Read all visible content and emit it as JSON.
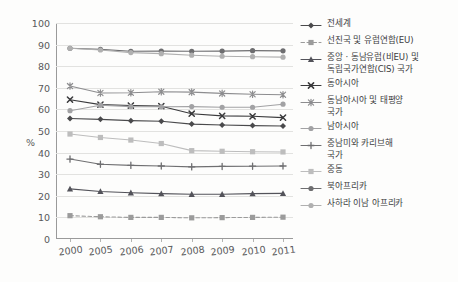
{
  "chart_data": {
    "type": "line",
    "title": "",
    "subtitle": "",
    "xlabel": "",
    "ylabel": "%",
    "ylim": [
      0,
      100
    ],
    "ytick_step": 10,
    "yticks": [
      0,
      10,
      20,
      30,
      40,
      50,
      60,
      70,
      80,
      90,
      100
    ],
    "grid": true,
    "legend_position": "right",
    "categories": [
      "2000",
      "2005",
      "2006",
      "2007",
      "2008",
      "2009",
      "2010",
      "2011"
    ],
    "x": [
      2000,
      2005,
      2006,
      2007,
      2008,
      2009,
      2010,
      2011
    ],
    "series": [
      {
        "name": "전세계",
        "values": [
          55.8,
          55.4,
          54.8,
          54.5,
          53.2,
          52.8,
          52.5,
          52.3
        ],
        "color": "#4a4a4c",
        "marker": "diamond",
        "dash": "solid"
      },
      {
        "name": "선진국 및 유럽연합(EU)",
        "values": [
          10.8,
          10.3,
          10.0,
          10.0,
          9.8,
          9.9,
          10.0,
          10.1
        ],
        "color": "#9b9b9b",
        "marker": "square",
        "dash": "dashed"
      },
      {
        "name": "중앙 · 동남유럽(비EU) 및\n독립국가연합(CIS) 국가",
        "values": [
          23.2,
          22.0,
          21.4,
          21.0,
          20.7,
          20.7,
          21.0,
          21.1
        ],
        "color": "#53535a",
        "marker": "triangle",
        "dash": "solid"
      },
      {
        "name": "동아시아",
        "values": [
          64.5,
          62.2,
          61.8,
          61.5,
          58.0,
          57.0,
          56.8,
          56.2
        ],
        "color": "#3a3a3c",
        "marker": "cross",
        "dash": "solid"
      },
      {
        "name": "동남아시아 및 태평양\n국가",
        "values": [
          70.8,
          67.6,
          67.7,
          68.2,
          68.0,
          67.4,
          67.0,
          66.8
        ],
        "color": "#8d8d8f",
        "marker": "asterisk",
        "dash": "solid"
      },
      {
        "name": "남아시아",
        "values": [
          59.4,
          61.9,
          61.3,
          61.2,
          61.3,
          61.0,
          61.0,
          62.4
        ],
        "color": "#a2a2a4",
        "marker": "dot",
        "dash": "solid"
      },
      {
        "name": "중남미와 카리브해\n국가",
        "values": [
          37.0,
          34.6,
          34.1,
          33.8,
          33.4,
          33.6,
          33.7,
          33.8
        ],
        "color": "#6f6f71",
        "marker": "plus",
        "dash": "solid"
      },
      {
        "name": "중동",
        "values": [
          48.6,
          47.0,
          45.8,
          44.2,
          40.9,
          40.6,
          40.4,
          40.3
        ],
        "color": "#bdbdbd",
        "marker": "square",
        "dash": "solid"
      },
      {
        "name": "북아프리카",
        "values": [
          88.3,
          87.8,
          86.9,
          87.0,
          86.9,
          87.0,
          87.2,
          87.1
        ],
        "color": "#6e6e70",
        "marker": "dot",
        "dash": "solid"
      },
      {
        "name": "사하라 이남 아프리카",
        "values": [
          88.3,
          87.5,
          86.3,
          85.8,
          85.1,
          84.6,
          84.4,
          84.2
        ],
        "color": "#b0b0b0",
        "marker": "dot",
        "dash": "solid"
      }
    ]
  },
  "axes": {
    "y_unit_label": "%",
    "ytick_labels": [
      "100",
      "90",
      "80",
      "70",
      "60",
      "50",
      "40",
      "30",
      "20",
      "10",
      "0"
    ],
    "xtick_labels": [
      "2000",
      "2005",
      "2006",
      "2007",
      "2008",
      "2009",
      "2010",
      "2011"
    ]
  },
  "legend": {
    "items": [
      {
        "label": "전세계"
      },
      {
        "label": "선진국 및 유럽연합(EU)"
      },
      {
        "label": "중앙 · 동남유럽(비EU) 및\n독립국가연합(CIS) 국가"
      },
      {
        "label": "동아시아"
      },
      {
        "label": "동남아시아 및 태평양\n국가"
      },
      {
        "label": "남아시아"
      },
      {
        "label": "중남미와 카리브해\n국가"
      },
      {
        "label": "중동"
      },
      {
        "label": "북아프리카"
      },
      {
        "label": "사하라 이남 아프리카"
      }
    ]
  },
  "colors": {
    "background": "#fdfdfc",
    "grid": "#e2e2e0",
    "axis": "#9a9a9a",
    "text": "#58585a"
  }
}
